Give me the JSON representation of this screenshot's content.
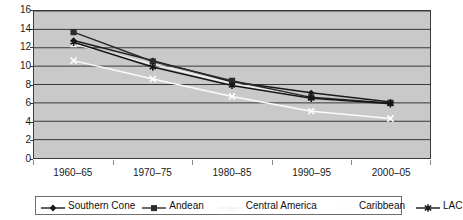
{
  "chart_data": {
    "type": "line",
    "title": "",
    "xlabel": "",
    "ylabel": "",
    "ylim": [
      0,
      16
    ],
    "ytick_step": 2,
    "yticks": [
      "16",
      "14",
      "12",
      "10",
      "8",
      "6",
      "4",
      "2",
      "0"
    ],
    "grid": true,
    "legend_position": "bottom",
    "categories": [
      "1960–65",
      "1970–75",
      "1980–85",
      "1990–95",
      "2000–05"
    ],
    "series": [
      {
        "name": "Southern Cone",
        "marker": "diamond",
        "color": "#1a1a1a",
        "values": [
          12.8,
          10.6,
          8.3,
          7.1,
          6.1
        ]
      },
      {
        "name": "Andean",
        "marker": "square",
        "color": "#2b2b2b",
        "values": [
          13.7,
          10.5,
          8.4,
          6.6,
          6.0
        ]
      },
      {
        "name": "Central America",
        "marker": "triangle",
        "color": "#f2f2f2",
        "values": [
          12.4,
          10.2,
          8.1,
          6.5,
          6.1
        ]
      },
      {
        "name": "Caribbean",
        "marker": "cross",
        "color": "#fbfbfb",
        "values": [
          10.6,
          8.6,
          6.7,
          5.1,
          4.3
        ]
      },
      {
        "name": "LAC",
        "marker": "asterisk",
        "color": "#161616",
        "values": [
          12.6,
          9.9,
          7.9,
          6.5,
          5.9
        ]
      }
    ]
  },
  "style": {
    "plot_background": "#c9c9c9",
    "gridline_color": "#3a3a3a",
    "frame_color": "#3a3a3a",
    "page_background": "#ffffff",
    "text_color": "#1a1a1a"
  }
}
